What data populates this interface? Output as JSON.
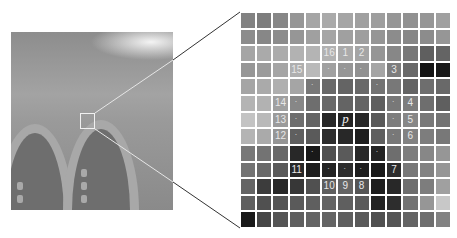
{
  "figure": {
    "center_label": "p",
    "circle_labels": [
      {
        "label": "1",
        "row": 2,
        "col": 6
      },
      {
        "label": "2",
        "row": 2,
        "col": 7
      },
      {
        "label": "3",
        "row": 3,
        "col": 9
      },
      {
        "label": "4",
        "row": 5,
        "col": 10
      },
      {
        "label": "5",
        "row": 6,
        "col": 10
      },
      {
        "label": "6",
        "row": 7,
        "col": 10
      },
      {
        "label": "7",
        "row": 9,
        "col": 9
      },
      {
        "label": "8",
        "row": 10,
        "col": 7
      },
      {
        "label": "9",
        "row": 10,
        "col": 6
      },
      {
        "label": "10",
        "row": 10,
        "col": 5
      },
      {
        "label": "11",
        "row": 9,
        "col": 3
      },
      {
        "label": "12",
        "row": 7,
        "col": 2
      },
      {
        "label": "13",
        "row": 6,
        "col": 2
      },
      {
        "label": "14",
        "row": 5,
        "col": 2
      },
      {
        "label": "15",
        "row": 3,
        "col": 3
      },
      {
        "label": "16",
        "row": 2,
        "col": 5
      }
    ],
    "circle_cells": [
      [
        3,
        5
      ],
      [
        3,
        6
      ],
      [
        3,
        7
      ],
      [
        4,
        8
      ],
      [
        5,
        9
      ],
      [
        6,
        9
      ],
      [
        7,
        9
      ],
      [
        8,
        8
      ],
      [
        9,
        7
      ],
      [
        9,
        6
      ],
      [
        9,
        5
      ],
      [
        8,
        4
      ],
      [
        7,
        3
      ],
      [
        6,
        3
      ],
      [
        5,
        3
      ],
      [
        4,
        4
      ]
    ],
    "center_cell": [
      6,
      6
    ],
    "grid_size": 13,
    "gray_levels": [
      [
        130,
        125,
        135,
        150,
        165,
        170,
        165,
        160,
        158,
        150,
        145,
        150,
        160
      ],
      [
        140,
        135,
        140,
        150,
        160,
        165,
        160,
        158,
        150,
        140,
        135,
        140,
        150
      ],
      [
        165,
        170,
        172,
        178,
        180,
        178,
        170,
        165,
        150,
        135,
        120,
        95,
        100
      ],
      [
        150,
        155,
        165,
        175,
        185,
        160,
        150,
        145,
        165,
        125,
        105,
        20,
        25
      ],
      [
        165,
        170,
        175,
        165,
        120,
        105,
        100,
        105,
        115,
        120,
        100,
        110,
        105
      ],
      [
        180,
        178,
        160,
        135,
        110,
        105,
        100,
        100,
        95,
        120,
        125,
        110,
        95
      ],
      [
        195,
        185,
        155,
        110,
        100,
        40,
        35,
        40,
        90,
        125,
        135,
        120,
        115
      ],
      [
        180,
        170,
        150,
        95,
        90,
        45,
        40,
        30,
        95,
        120,
        130,
        125,
        120
      ],
      [
        120,
        115,
        105,
        40,
        25,
        80,
        90,
        40,
        35,
        110,
        125,
        135,
        150
      ],
      [
        115,
        105,
        90,
        40,
        30,
        35,
        45,
        30,
        25,
        45,
        120,
        130,
        150
      ],
      [
        100,
        60,
        40,
        55,
        80,
        95,
        100,
        85,
        30,
        40,
        110,
        125,
        160
      ],
      [
        95,
        80,
        85,
        90,
        95,
        100,
        95,
        90,
        35,
        45,
        115,
        150,
        200
      ],
      [
        25,
        70,
        85,
        95,
        100,
        100,
        95,
        90,
        80,
        85,
        100,
        110,
        130
      ]
    ]
  }
}
